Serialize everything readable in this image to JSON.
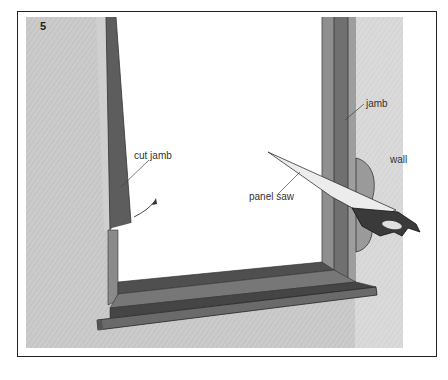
{
  "figure": {
    "number": "5"
  },
  "labels": {
    "jamb": "jamb",
    "wall": "wall",
    "cut_jamb": "cut jamb",
    "panel_saw": "panel saw"
  },
  "colors": {
    "wall": "#c9c9c9",
    "jamb_dark": "#6f6f6f",
    "jamb_mid": "#8c8c8c",
    "sill_dark": "#4e4e4e",
    "opening": "#ffffff",
    "blade": "#e9e9e9",
    "handle": "#3a3a3a",
    "border": "#222222"
  }
}
